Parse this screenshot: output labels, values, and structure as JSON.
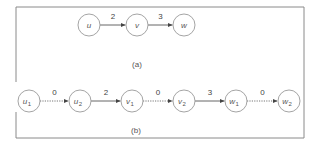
{
  "diagram": {
    "panel_a": {
      "caption": "(a)",
      "nodes": [
        {
          "id": "u",
          "label": "u",
          "sub": "",
          "cx": 89,
          "cy": 25
        },
        {
          "id": "v",
          "label": "v",
          "sub": "",
          "cx": 137,
          "cy": 25
        },
        {
          "id": "w",
          "label": "w",
          "sub": "",
          "cx": 184,
          "cy": 25
        }
      ],
      "edges": [
        {
          "from": "u",
          "to": "v",
          "label": "2",
          "style": "solid"
        },
        {
          "from": "v",
          "to": "w",
          "label": "3",
          "style": "solid"
        }
      ]
    },
    "panel_b": {
      "caption": "(b)",
      "nodes": [
        {
          "id": "u1",
          "label": "u",
          "sub": "1",
          "cx": 29,
          "cy": 101
        },
        {
          "id": "u2",
          "label": "u",
          "sub": "2",
          "cx": 80,
          "cy": 101
        },
        {
          "id": "v1",
          "label": "v",
          "sub": "1",
          "cx": 132,
          "cy": 101
        },
        {
          "id": "v2",
          "label": "v",
          "sub": "2",
          "cx": 184,
          "cy": 101
        },
        {
          "id": "w1",
          "label": "w",
          "sub": "1",
          "cx": 236,
          "cy": 101
        },
        {
          "id": "w2",
          "label": "w",
          "sub": "2",
          "cx": 289,
          "cy": 101
        }
      ],
      "edges": [
        {
          "from": "u1",
          "to": "u2",
          "label": "0",
          "style": "dotted"
        },
        {
          "from": "u2",
          "to": "v1",
          "label": "2",
          "style": "solid"
        },
        {
          "from": "v1",
          "to": "v2",
          "label": "0",
          "style": "dotted"
        },
        {
          "from": "v2",
          "to": "w1",
          "label": "3",
          "style": "solid"
        },
        {
          "from": "w1",
          "to": "w2",
          "label": "0",
          "style": "dotted"
        }
      ]
    },
    "colors": {
      "node_stroke": "#9a9a9a",
      "edge": "#555555",
      "frame": "#8a8a8a",
      "text": "#555555"
    }
  }
}
